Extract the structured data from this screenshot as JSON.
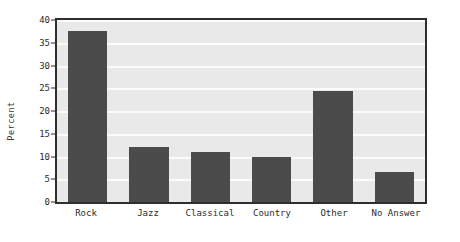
{
  "chart_data": {
    "type": "bar",
    "title": "",
    "xlabel": "",
    "ylabel": "Percent",
    "categories": [
      "Rock",
      "Jazz",
      "Classical",
      "Country",
      "Other",
      "No Answer"
    ],
    "values": [
      37.5,
      12,
      11,
      10,
      24.5,
      6.5
    ],
    "ylim": [
      0,
      40
    ],
    "ytick_values": [
      0,
      5,
      10,
      15,
      20,
      25,
      30,
      35,
      40
    ],
    "ytick_labels": [
      "0",
      "5",
      "10",
      "15",
      "20",
      "25",
      "30",
      "35",
      "40"
    ],
    "grid": true,
    "legend": false,
    "colors": {
      "bar_fill": "#4b4b4b",
      "plot_background": "#e9e9e9",
      "gridline": "#fbfbfb",
      "axis_border": "#2e2e2e",
      "text": "#2b2b2b",
      "figure_background": "#ffffff"
    }
  }
}
